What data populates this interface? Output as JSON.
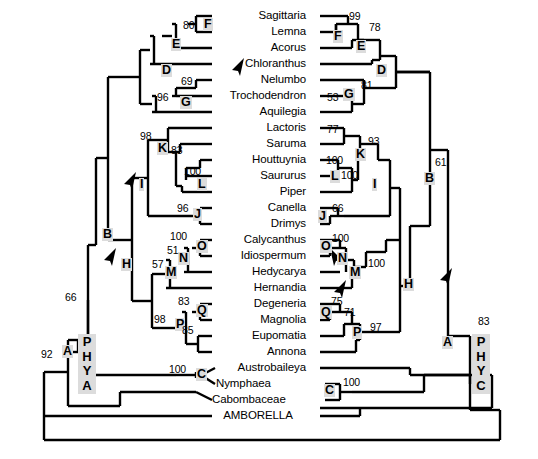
{
  "figure": {
    "type": "phylogenetic-cladogram-pair",
    "gene_trees": [
      {
        "id": "phya",
        "label": "PHYA",
        "side": "left"
      },
      {
        "id": "phyc",
        "label": "PHYC",
        "side": "right"
      }
    ]
  },
  "taxa": [
    {
      "i": 0,
      "name": "Sagittaria"
    },
    {
      "i": 1,
      "name": "Lemna"
    },
    {
      "i": 2,
      "name": "Acorus"
    },
    {
      "i": 3,
      "name": "Chloranthus"
    },
    {
      "i": 4,
      "name": "Nelumbo"
    },
    {
      "i": 5,
      "name": "Trochodendron"
    },
    {
      "i": 6,
      "name": "Aquilegia"
    },
    {
      "i": 7,
      "name": "Lactoris"
    },
    {
      "i": 8,
      "name": "Saruma"
    },
    {
      "i": 9,
      "name": "Houttuynia"
    },
    {
      "i": 10,
      "name": "Saururus"
    },
    {
      "i": 11,
      "name": "Piper"
    },
    {
      "i": 12,
      "name": "Canella"
    },
    {
      "i": 13,
      "name": "Drimys"
    },
    {
      "i": 14,
      "name": "Calycanthus"
    },
    {
      "i": 15,
      "name": "Idiospermum"
    },
    {
      "i": 16,
      "name": "Hedycarya"
    },
    {
      "i": 17,
      "name": "Hernandia"
    },
    {
      "i": 18,
      "name": "Degeneria"
    },
    {
      "i": 19,
      "name": "Magnolia"
    },
    {
      "i": 20,
      "name": "Eupomatia"
    },
    {
      "i": 21,
      "name": "Annona"
    },
    {
      "i": 22,
      "name": "Austrobaileya"
    },
    {
      "i": 23,
      "name": "Nymphaea"
    },
    {
      "i": 24,
      "name": "Cabombaceae"
    },
    {
      "i": 25,
      "name": "AMBORELLA"
    }
  ],
  "phya": {
    "gene_label": "PHYA",
    "node_labels": [
      {
        "id": "A",
        "label": "A"
      },
      {
        "id": "B",
        "label": "B"
      },
      {
        "id": "C",
        "label": "C"
      },
      {
        "id": "D",
        "label": "D"
      },
      {
        "id": "E",
        "label": "E"
      },
      {
        "id": "F",
        "label": "F"
      },
      {
        "id": "G",
        "label": "G"
      },
      {
        "id": "H",
        "label": "H"
      },
      {
        "id": "I",
        "label": "I"
      },
      {
        "id": "J",
        "label": "J"
      },
      {
        "id": "K",
        "label": "K"
      },
      {
        "id": "L",
        "label": "L"
      },
      {
        "id": "M",
        "label": "M"
      },
      {
        "id": "N",
        "label": "N"
      },
      {
        "id": "O",
        "label": "O"
      },
      {
        "id": "P",
        "label": "P"
      },
      {
        "id": "Q",
        "label": "Q"
      }
    ],
    "support_values": [
      {
        "id": "F",
        "value": "80"
      },
      {
        "id": "G_upper",
        "value": "69"
      },
      {
        "id": "G_lower",
        "value": "96"
      },
      {
        "id": "K",
        "value": "98"
      },
      {
        "id": "K_inner",
        "value": "83"
      },
      {
        "id": "L",
        "value": "100"
      },
      {
        "id": "J",
        "value": "96"
      },
      {
        "id": "O",
        "value": "100"
      },
      {
        "id": "N",
        "value": "51"
      },
      {
        "id": "M",
        "value": "57"
      },
      {
        "id": "Q",
        "value": "83"
      },
      {
        "id": "P",
        "value": "98"
      },
      {
        "id": "P_inner",
        "value": "85"
      },
      {
        "id": "C",
        "value": "100"
      },
      {
        "id": "B",
        "value": "66"
      },
      {
        "id": "A",
        "value": "92"
      }
    ]
  },
  "phyc": {
    "gene_label": "PHYC",
    "node_labels": [
      {
        "id": "A",
        "label": "A"
      },
      {
        "id": "B",
        "label": "B"
      },
      {
        "id": "C",
        "label": "C"
      },
      {
        "id": "D",
        "label": "D"
      },
      {
        "id": "E",
        "label": "E"
      },
      {
        "id": "F",
        "label": "F"
      },
      {
        "id": "G",
        "label": "G"
      },
      {
        "id": "H",
        "label": "H"
      },
      {
        "id": "I",
        "label": "I"
      },
      {
        "id": "J",
        "label": "J"
      },
      {
        "id": "K",
        "label": "K"
      },
      {
        "id": "L",
        "label": "L"
      },
      {
        "id": "M",
        "label": "M"
      },
      {
        "id": "N",
        "label": "N"
      },
      {
        "id": "O",
        "label": "O"
      },
      {
        "id": "P",
        "label": "P"
      },
      {
        "id": "Q",
        "label": "Q"
      }
    ],
    "support_values": [
      {
        "id": "F_inner",
        "value": "99"
      },
      {
        "id": "E",
        "value": "78"
      },
      {
        "id": "G",
        "value": "53"
      },
      {
        "id": "D",
        "value": "81"
      },
      {
        "id": "K_inner",
        "value": "77"
      },
      {
        "id": "K",
        "value": "93"
      },
      {
        "id": "L_upper",
        "value": "100"
      },
      {
        "id": "L_lower",
        "value": "100"
      },
      {
        "id": "J",
        "value": "66"
      },
      {
        "id": "O",
        "value": "100"
      },
      {
        "id": "M",
        "value": "100"
      },
      {
        "id": "Q",
        "value": "75"
      },
      {
        "id": "P_inner",
        "value": "71"
      },
      {
        "id": "P",
        "value": "97"
      },
      {
        "id": "C",
        "value": "100"
      },
      {
        "id": "B",
        "value": "61"
      },
      {
        "id": "A",
        "value": "83"
      }
    ]
  },
  "annotations": {
    "arrows": [
      {
        "id": "arrow-phyc-D",
        "target": "PHYC node D"
      },
      {
        "id": "arrow-phya-I",
        "target": "PHYA node I"
      },
      {
        "id": "arrow-phya-H",
        "target": "PHYA node H"
      },
      {
        "id": "arrow-phyc-N",
        "target": "PHYC node N"
      },
      {
        "id": "arrow-phyc-H",
        "target": "PHYC node H"
      },
      {
        "id": "arrow-phyc-A",
        "target": "PHYC node A"
      }
    ]
  }
}
